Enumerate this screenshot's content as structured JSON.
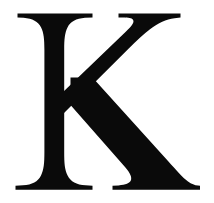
{
  "image": {
    "kind": "letterform-glyph",
    "character": "K",
    "description": "Large black serif capital letter K centered on a plain white background",
    "typeface_style": "serif",
    "case": "uppercase",
    "canvas": {
      "width": 214,
      "height": 203
    },
    "colors": {
      "glyph": "#0a0a0a",
      "background": "#ffffff"
    },
    "metrics": {
      "cap_top_y": 13,
      "baseline_y": 190,
      "cap_height": 177,
      "glyph_left_x": 15,
      "glyph_right_x": 200,
      "glyph_width": 185,
      "stem_left_x": 36,
      "stem_right_x": 62,
      "stem_width": 26,
      "junction_x": 62,
      "junction_y": 100,
      "top_serif_left_span": [
        17,
        92
      ],
      "top_serif_right_span": [
        118,
        180
      ],
      "foot_serif_left_span": [
        15,
        92
      ],
      "foot_serif_right_span": [
        112,
        200
      ]
    },
    "parts": [
      "top-left-serif",
      "vertical-stem",
      "bottom-left-serif",
      "upper-arm-diagonal",
      "top-right-serif",
      "lower-leg-diagonal",
      "bottom-right-serif"
    ]
  }
}
